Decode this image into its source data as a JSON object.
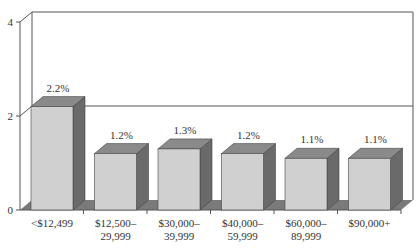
{
  "chart_data": {
    "type": "bar",
    "style": "3d-column",
    "title": "",
    "xlabel": "",
    "ylabel": "",
    "ylim": [
      0,
      4
    ],
    "yticks": [
      "0",
      "2",
      "4"
    ],
    "grid": true,
    "legend": null,
    "categories": [
      "<$12,499",
      "$12,500–29,999",
      "$30,000–39,999",
      "$40,000–59,999",
      "$60,000–89,999",
      "$90,000+"
    ],
    "category_lines": [
      [
        "<$12,499"
      ],
      [
        "$12,500–",
        "29,999"
      ],
      [
        "$30,000–",
        "39,999"
      ],
      [
        "$40,000–",
        "59,999"
      ],
      [
        "$60,000–",
        "89,999"
      ],
      [
        "$90,000+"
      ]
    ],
    "values": [
      2.2,
      1.2,
      1.3,
      1.2,
      1.1,
      1.1
    ],
    "data_labels": [
      "2.2%",
      "1.2%",
      "1.3%",
      "1.2%",
      "1.1%",
      "1.1%"
    ]
  },
  "colors": {
    "bar_front": "#d0d0d0",
    "bar_top": "#8a8a8a",
    "bar_side": "#6a6a6a",
    "floor": "#7a7a7a",
    "axis": "#555555"
  }
}
